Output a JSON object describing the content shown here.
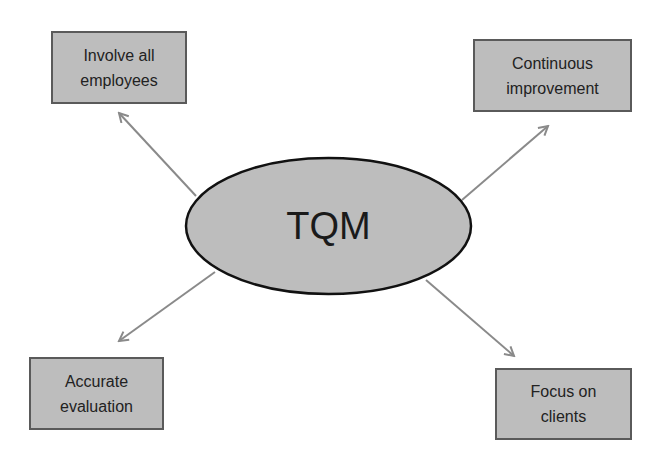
{
  "center": {
    "label": "TQM"
  },
  "nodes": [
    {
      "id": "involve",
      "line1": "Involve all",
      "line2": "employees"
    },
    {
      "id": "continuous",
      "line1": "Continuous",
      "line2": "improvement"
    },
    {
      "id": "accurate",
      "line1": "Accurate",
      "line2": "evaluation"
    },
    {
      "id": "focus",
      "line1": "Focus on",
      "line2": "clients"
    }
  ],
  "colors": {
    "fill": "#bdbdbd",
    "box_border": "#5a5a5a",
    "ellipse_border": "#111111",
    "arrow": "#8a8a8a"
  }
}
